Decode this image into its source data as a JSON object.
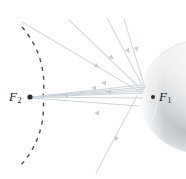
{
  "figure": {
    "type": "optics-ray-diagram",
    "width": 186,
    "height": 179,
    "background_color": "#ffffff",
    "labels": {
      "focus_left": "F",
      "focus_left_sub": "2",
      "focus_right": "F",
      "focus_right_sub": "1"
    },
    "colors": {
      "ray": "#d8dde2",
      "ray_dark": "#c3c9cf",
      "arrowhead": "#c8ced4",
      "dashed_arc": "#4a4a4a",
      "focus_dot": "#2b2b2b",
      "label_text": "#1a1a1a",
      "mirror_light": "#fdfdfd",
      "mirror_mid": "#c9cdd0",
      "mirror_shadow": "#9aa0a5",
      "mirror_edge": "#e6e8ea"
    },
    "focus_points": [
      {
        "name": "F2",
        "x": 30,
        "y": 97,
        "radius": 2.6
      },
      {
        "name": "F1",
        "x": 153,
        "y": 97,
        "radius": 2.0
      }
    ],
    "mirror": {
      "shape": "ellipsoid-dome",
      "vertex_x": 140,
      "center_y": 97,
      "semi_major": 62,
      "semi_minor": 57
    },
    "dashed_arc": {
      "center_x": -44,
      "center_y": 97,
      "radius": 87,
      "dash_pattern": "4 5",
      "stroke_width": 1.4
    },
    "incoming_rays": [
      {
        "x1": 22,
        "y1": 22,
        "x2": 141,
        "y2": 92
      },
      {
        "x1": 69,
        "y1": 20,
        "x2": 142,
        "y2": 90
      },
      {
        "x1": 107,
        "y1": 18,
        "x2": 143,
        "y2": 89
      },
      {
        "x1": 123,
        "y1": 19,
        "x2": 144,
        "y2": 89
      },
      {
        "x1": 136,
        "y1": 95,
        "x2": 97,
        "y2": 172
      }
    ],
    "reflected_rays": [
      {
        "x1": 141,
        "y1": 92,
        "x2": 31,
        "y2": 97
      },
      {
        "x1": 142,
        "y1": 90,
        "x2": 31,
        "y2": 97
      },
      {
        "x1": 143,
        "y1": 88,
        "x2": 31,
        "y2": 97
      },
      {
        "x1": 144,
        "y1": 87,
        "x2": 31,
        "y2": 97
      },
      {
        "x1": 140,
        "y1": 104,
        "x2": 31,
        "y2": 98
      }
    ],
    "arrowheads": [
      {
        "x": 95,
        "y": 65,
        "angle": 30
      },
      {
        "x": 109,
        "y": 55,
        "angle": 44
      },
      {
        "x": 126,
        "y": 48,
        "angle": 63
      },
      {
        "x": 130,
        "y": 44,
        "angle": 73
      },
      {
        "x": 118,
        "y": 137,
        "angle": 117
      },
      {
        "x": 106,
        "y": 82,
        "angle": 182
      },
      {
        "x": 98,
        "y": 87,
        "angle": 184
      },
      {
        "x": 110,
        "y": 91,
        "angle": 180
      },
      {
        "x": 100,
        "y": 112,
        "angle": 177
      },
      {
        "x": 69,
        "y": 94,
        "angle": 181
      }
    ]
  }
}
